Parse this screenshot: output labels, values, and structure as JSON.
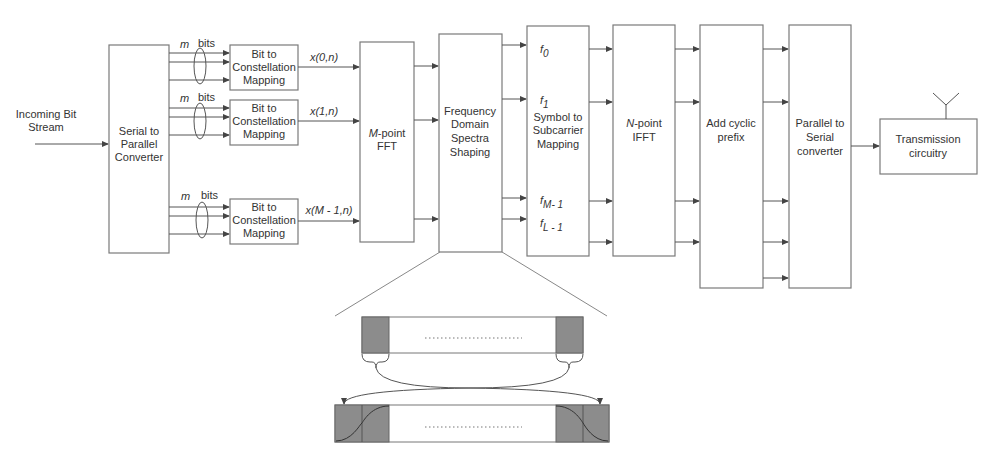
{
  "input": {
    "label_line1": "Incoming Bit",
    "label_line2": "Stream"
  },
  "blocks": {
    "serial_to_parallel": {
      "lines": [
        "Serial to",
        "Parallel",
        "Converter"
      ]
    },
    "bit_to_constellation": [
      {
        "lines": [
          "Bit to",
          "Constellation",
          "Mapping"
        ],
        "bits_m": "m",
        "bits_label": "bits",
        "output": "x(0,n)"
      },
      {
        "lines": [
          "Bit to",
          "Constellation",
          "Mapping"
        ],
        "bits_m": "m",
        "bits_label": "bits",
        "output": "x(1,n)"
      },
      {
        "lines": [
          "Bit to",
          "Constellation",
          "Mapping"
        ],
        "bits_m": "m",
        "bits_label": "bits",
        "output": "x(M - 1,n)"
      }
    ],
    "fft": {
      "var": "M",
      "line1": "-point",
      "line2": "FFT"
    },
    "fdss": {
      "lines": [
        "Frequency",
        "Domain",
        "Spectra",
        "Shaping"
      ]
    },
    "subcarrier_mapping": {
      "lines": [
        "Symbol to",
        "Subcarrier",
        "Mapping"
      ],
      "f0": "f",
      "f0_sub": "0",
      "f1": "f",
      "f1_sub": "1",
      "fM": "f",
      "fM_sub": "M- 1",
      "fL": "f",
      "fL_sub": "L - 1"
    },
    "ifft": {
      "var": "N",
      "line1": "-point",
      "line2": "IFFT"
    },
    "cyclic_prefix": {
      "lines": [
        "Add cyclic",
        "prefix"
      ]
    },
    "parallel_to_serial": {
      "lines": [
        "Parallel to",
        "Serial",
        "converter"
      ]
    },
    "transmission": {
      "lines": [
        "Transmission",
        "circuitry"
      ]
    }
  },
  "inset": {
    "description": "Spectrum shaping detail: edge subcarriers copied/extended with raised-cosine roll-off",
    "dots": "........................."
  },
  "colors": {
    "block_stroke": "#7a7a7a",
    "wire": "#555555",
    "shaded": "#8c8c8c",
    "background": "#ffffff"
  }
}
